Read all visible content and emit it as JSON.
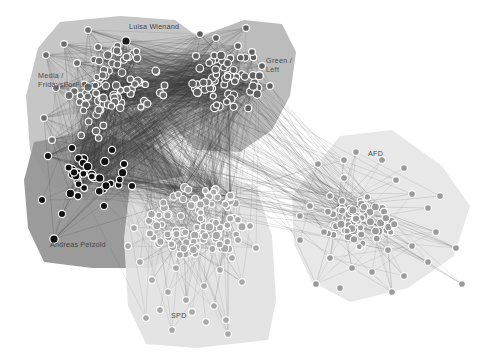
{
  "figure": {
    "kind": "network-graph",
    "title": "",
    "background_color": "#ffffff",
    "width": 500,
    "height": 360
  },
  "chart_data": {
    "type": "scatter",
    "title": "",
    "xlabel": "",
    "ylabel": "",
    "grid": false,
    "legend_position": "none",
    "clusters": [
      {
        "id": "media-fff",
        "label": "Media /\nFridaysForFuture",
        "label_lines": [
          "Media /",
          "FridaysForFuture"
        ],
        "label_x": 38,
        "label_y": 78,
        "hull_color": "#c3c3c3",
        "hull_opacity": 0.95,
        "node_color": "#6d6d6d",
        "node_stroke": "#ffffff",
        "node_count": 78
      },
      {
        "id": "green-left",
        "label": "Green /\nLeft",
        "label_lines": [
          "Green /",
          "Left"
        ],
        "label_x": 266,
        "label_y": 63,
        "hull_color": "#b5b5b5",
        "hull_opacity": 0.9,
        "node_color": "#606060",
        "node_stroke": "#ffffff",
        "node_count": 72
      },
      {
        "id": "andreas-petzold-group",
        "label": "",
        "label_lines": [],
        "label_x": 0,
        "label_y": 0,
        "hull_color": "#969696",
        "hull_opacity": 0.95,
        "node_color": "#111111",
        "node_stroke": "#ffffff",
        "node_count": 40
      },
      {
        "id": "spd",
        "label": "SPD",
        "label_lines": [
          "SPD"
        ],
        "label_x": 171,
        "label_y": 318,
        "hull_color": "#e2e2e2",
        "hull_opacity": 0.92,
        "node_color": "#a8a8a8",
        "node_stroke": "#ffffff",
        "node_count": 120
      },
      {
        "id": "afd",
        "label": "AFD",
        "label_lines": [
          "AFD"
        ],
        "label_x": 368,
        "label_y": 156,
        "hull_color": "#e6e6e6",
        "hull_opacity": 0.92,
        "node_color": "#9b9b9b",
        "node_stroke": "#ffffff",
        "node_count": 86
      }
    ],
    "annotated_nodes": [
      {
        "id": "luisa-wienand",
        "label": "Luisa Wienand",
        "label_x": 129,
        "label_y": 29,
        "node_x": 126,
        "node_y": 41,
        "node_color": "#1b1b1b",
        "node_radius": 4.2
      },
      {
        "id": "andreas-petzold",
        "label": "Andreas Petzold",
        "label_x": 50,
        "label_y": 247,
        "node_x": 54,
        "node_y": 239,
        "node_color": "#101010",
        "node_radius": 4.2
      }
    ],
    "edges": {
      "color": "#3a3a3a",
      "opacity": 0.42,
      "width": 0.45,
      "approx_count": 3200,
      "core_density": "very-high"
    },
    "axis_ranges": {
      "x": [
        0,
        500
      ],
      "y": [
        0,
        360
      ]
    }
  }
}
